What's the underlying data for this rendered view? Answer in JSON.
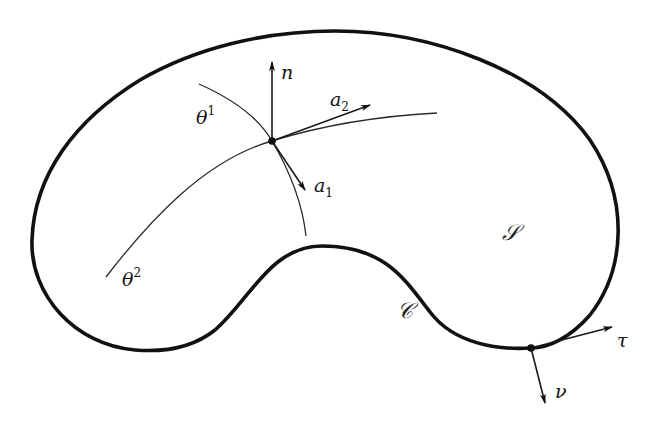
{
  "diagram": {
    "colors": {
      "ink": "#111111",
      "background": "#ffffff"
    },
    "labels": {
      "normal": "n",
      "base_vector_1": {
        "base": "a",
        "sub": "1"
      },
      "base_vector_2": {
        "base": "a",
        "sub": "2"
      },
      "coord_line_1": {
        "base": "θ",
        "sup": "1"
      },
      "coord_line_2": {
        "base": "θ",
        "sup": "2"
      },
      "surface": "𝒮",
      "boundary": "𝒞",
      "tangent": "τ",
      "boundary_normal": "ν"
    },
    "points": {
      "surface_point": [
        272,
        141
      ],
      "boundary_point": [
        531,
        348
      ]
    }
  }
}
